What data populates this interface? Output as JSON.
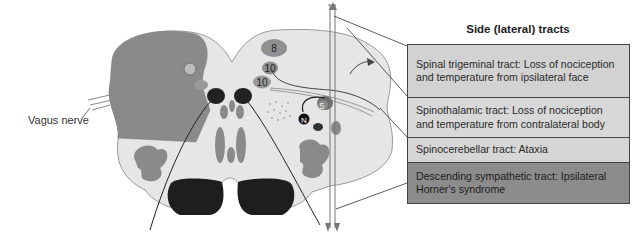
{
  "figure": {
    "panel_title": "Side (lateral) tracts",
    "left_label": "Vagus nerve",
    "nucleus_labels": [
      "8",
      "10",
      "10",
      "5",
      "N"
    ],
    "tracts": [
      {
        "text": "Spinal trigeminal tract: Loss of nociception and temperature from ipsilateral face",
        "color": "#d2d2d2"
      },
      {
        "text": "Spinothalamic tract: Loss of nociception and temperature from contralateral body",
        "color": "#d8d8d8"
      },
      {
        "text": "Spinocerebellar tract: Ataxia",
        "color": "#d6d6d6"
      },
      {
        "text": "Descending sympathetic tract: Ipsilateral Horner's syndrome",
        "color": "#8c8c8c"
      }
    ],
    "colors": {
      "medulla_fill": "#e6e6e6",
      "lesion_fill": "#8a8a8a",
      "pyramid_fill": "#1e1e1e",
      "nucleus_fill": "#8f8f8f"
    }
  }
}
